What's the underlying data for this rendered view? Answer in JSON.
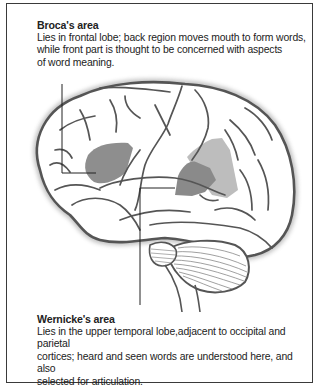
{
  "diagram": {
    "colors": {
      "frame": "#3a3a3a",
      "outline": "#555555",
      "broca_fill": "#8e8e8e",
      "wernicke_fill_dark": "#8a8a8a",
      "wernicke_fill_light": "#bdbdbd",
      "text": "#222222"
    },
    "labels": [
      {
        "id": "broca",
        "title": "Broca's area",
        "lines": [
          "Lies in frontal lobe; back region moves mouth to form words,",
          "while front part is thought to be concerned with aspects",
          "of word meaning."
        ],
        "description": "Lies in frontal lobe; back region moves mouth to form words,\nwhile front part is thought to be concerned with aspects\nof word meaning."
      },
      {
        "id": "wernicke",
        "title": "Wernicke's area",
        "lines": [
          "Lies in the upper temporal lobe,adjacent to occipital and parietal",
          "cortices; heard and seen words are understood here, and also",
          "selected for articulation."
        ],
        "description": "Lies in the upper temporal lobe,adjacent to occipital and parietal\ncortices; heard and seen words are understood here, and also\nselected for articulation."
      }
    ],
    "structures": [
      "cerebrum",
      "frontal lobe",
      "temporal lobe",
      "cerebellum",
      "brainstem"
    ]
  }
}
